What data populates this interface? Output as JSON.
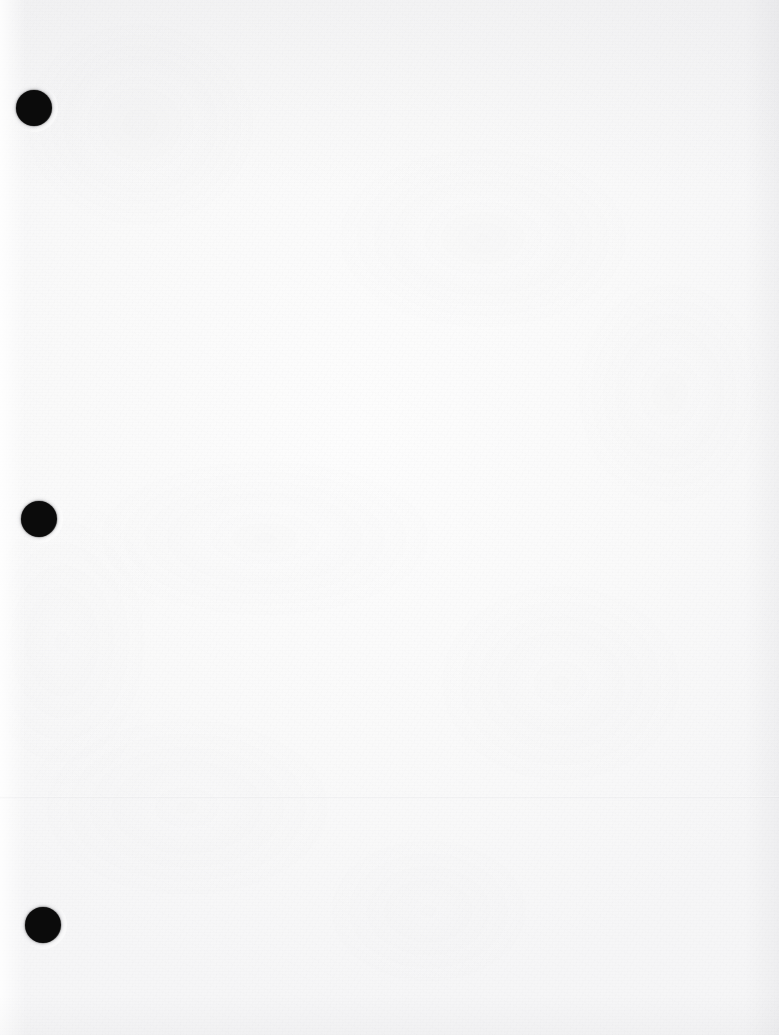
{
  "document": {
    "type": "scanned-page",
    "title": "Scanned blank page",
    "content_text": "",
    "orientation": "portrait",
    "page_width_px": 779,
    "page_height_px": 1035,
    "paper_color": "#fbfbfb",
    "paper_shadow_color": "#9a9aa2",
    "note": "Blank sheet — no printed or handwritten text visible"
  },
  "binder_holes": {
    "name": "three-hole-punch",
    "count": 3,
    "color": "#0b0b0b",
    "diameter_px": 36,
    "items": [
      {
        "label": "top-hole",
        "x": 16,
        "y": 90,
        "diameter": 36
      },
      {
        "label": "middle-hole",
        "x": 21,
        "y": 501,
        "diameter": 36
      },
      {
        "label": "bottom-hole",
        "x": 25,
        "y": 907,
        "diameter": 36
      }
    ]
  },
  "scan_artifacts": {
    "fold_line": {
      "label": "horizontal-crease",
      "y": 796
    },
    "top_shading": {
      "label": "top-edge-shading",
      "height": 190
    },
    "left_shading": {
      "label": "left-margin-highlight",
      "width": 26
    },
    "right_shading": {
      "label": "right-edge-shading",
      "width": 34
    },
    "bottom_shading": {
      "label": "bottom-edge-shading",
      "height": 40
    }
  }
}
